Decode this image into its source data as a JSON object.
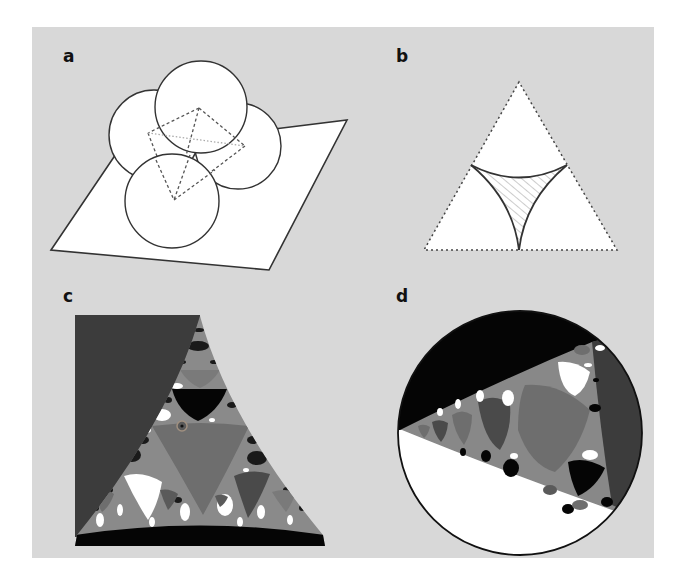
{
  "figure": {
    "background": "#d8d8d8",
    "panels": [
      {
        "label": "a",
        "description": "Four mutually tangent spheres resting on a plane, with dashed tetrahedron joining their centres"
      },
      {
        "label": "b",
        "description": "Dashed equilateral triangle containing a hatched curvilinear triangle bounded by three circular arcs"
      },
      {
        "label": "c",
        "description": "Grayscale fractal (Apollonian-type) tiling within a curved triangle; dark gray region at left, black band at bottom"
      },
      {
        "label": "d",
        "description": "Grayscale fractal tiling inside a circle; black cap at top, white cap at bottom, dark gray region at right"
      }
    ]
  },
  "colors": {
    "black": "#050505",
    "white": "#ffffff",
    "dark_gray": "#3c3c3c",
    "mid_gray": "#6e6e6e",
    "light_gray": "#9a9a9a",
    "line": "#333333",
    "hatch": "#aaaaaa"
  }
}
